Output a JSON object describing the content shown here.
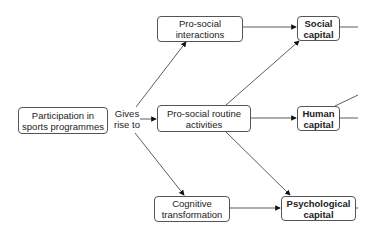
{
  "diagram": {
    "nodes": {
      "participation": "Participation in sports programmes",
      "interactions": "Pro-social interactions",
      "routine": "Pro-social routine activities",
      "cognitive": "Cognitive transformation",
      "social_capital": "Social capital",
      "human_capital": "Human capital",
      "psych_capital": "Psychological capital"
    },
    "edge_label": "Gives rise to",
    "edges": [
      {
        "from": "participation",
        "to": "interactions"
      },
      {
        "from": "participation",
        "to": "routine"
      },
      {
        "from": "participation",
        "to": "cognitive"
      },
      {
        "from": "interactions",
        "to": "social_capital"
      },
      {
        "from": "routine",
        "to": "social_capital"
      },
      {
        "from": "routine",
        "to": "human_capital"
      },
      {
        "from": "routine",
        "to": "psych_capital"
      },
      {
        "from": "cognitive",
        "to": "psych_capital"
      }
    ]
  }
}
